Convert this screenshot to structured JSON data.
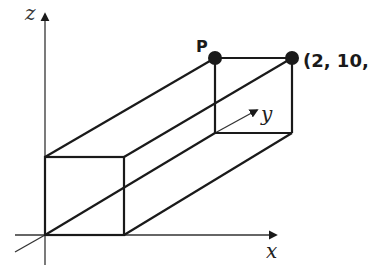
{
  "diagram": {
    "type": "3D rectangular box in coordinate axes",
    "axes": {
      "x_label": "x",
      "y_label": "y",
      "z_label": "z"
    },
    "points": {
      "P_label": "P",
      "corner_label": "(2, 10,"
    },
    "colors": {
      "line": "#1a1a1a",
      "axis": "#333333",
      "background": "#ffffff"
    }
  }
}
